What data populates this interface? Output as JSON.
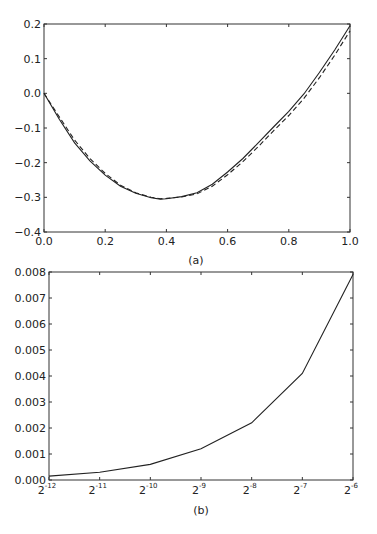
{
  "figure": {
    "panels": [
      {
        "id": "a",
        "caption": "(a)"
      },
      {
        "id": "b",
        "caption": "(b)"
      }
    ]
  },
  "chart_data": [
    {
      "type": "line",
      "panel": "(a)",
      "title": "",
      "xlabel": "",
      "ylabel": "",
      "xlim": [
        0.0,
        1.0
      ],
      "ylim": [
        -0.4,
        0.2
      ],
      "xticks": [
        0.0,
        0.2,
        0.4,
        0.6,
        0.8,
        1.0
      ],
      "xtick_labels": [
        "0.0",
        "0.2",
        "0.4",
        "0.6",
        "0.8",
        "1.0"
      ],
      "yticks": [
        -0.4,
        -0.3,
        -0.2,
        -0.1,
        0.0,
        0.1,
        0.2
      ],
      "ytick_labels": [
        "−0.4",
        "−0.3",
        "−0.2",
        "−0.1",
        "0.0",
        "0.1",
        "0.2"
      ],
      "grid": false,
      "legend": null,
      "series": [
        {
          "name": "solid",
          "style": "solid",
          "color": "#222222",
          "x": [
            0.0,
            0.05,
            0.1,
            0.15,
            0.2,
            0.25,
            0.3,
            0.35,
            0.38,
            0.4,
            0.45,
            0.5,
            0.55,
            0.6,
            0.65,
            0.7,
            0.75,
            0.8,
            0.85,
            0.9,
            0.95,
            1.0
          ],
          "y": [
            0.0,
            -0.075,
            -0.143,
            -0.195,
            -0.236,
            -0.268,
            -0.288,
            -0.301,
            -0.305,
            -0.304,
            -0.298,
            -0.287,
            -0.262,
            -0.227,
            -0.188,
            -0.143,
            -0.097,
            -0.052,
            -0.001,
            0.06,
            0.125,
            0.195
          ]
        },
        {
          "name": "dashed",
          "style": "dashed",
          "color": "#222222",
          "x": [
            0.0,
            0.05,
            0.1,
            0.15,
            0.2,
            0.25,
            0.3,
            0.35,
            0.38,
            0.4,
            0.45,
            0.5,
            0.55,
            0.6,
            0.65,
            0.7,
            0.75,
            0.8,
            0.85,
            0.9,
            0.95,
            1.0
          ],
          "y": [
            0.0,
            -0.068,
            -0.135,
            -0.188,
            -0.231,
            -0.265,
            -0.287,
            -0.3,
            -0.304,
            -0.303,
            -0.299,
            -0.29,
            -0.268,
            -0.235,
            -0.197,
            -0.154,
            -0.108,
            -0.064,
            -0.014,
            0.045,
            0.11,
            0.18
          ]
        }
      ]
    },
    {
      "type": "line",
      "panel": "(b)",
      "title": "",
      "xlabel": "",
      "ylabel": "",
      "xscale": "log2",
      "categories": [
        "2^-12",
        "2^-11",
        "2^-10",
        "2^-9",
        "2^-8",
        "2^-7",
        "2^-6"
      ],
      "xtick_base": [
        "2",
        "2",
        "2",
        "2",
        "2",
        "2",
        "2"
      ],
      "xtick_exp": [
        "-12",
        "-11",
        "-10",
        "-9",
        "-8",
        "-7",
        "-6"
      ],
      "ylim": [
        0.0,
        0.008
      ],
      "yticks": [
        0.0,
        0.001,
        0.002,
        0.003,
        0.004,
        0.005,
        0.006,
        0.007,
        0.008
      ],
      "ytick_labels": [
        "0.000",
        "0.001",
        "0.002",
        "0.003",
        "0.004",
        "0.005",
        "0.006",
        "0.007",
        "0.008"
      ],
      "grid": false,
      "legend": null,
      "series": [
        {
          "name": "error",
          "style": "solid",
          "color": "#222222",
          "values": [
            0.00015,
            0.0003,
            0.0006,
            0.0012,
            0.0022,
            0.0041,
            0.0079
          ]
        }
      ]
    }
  ]
}
